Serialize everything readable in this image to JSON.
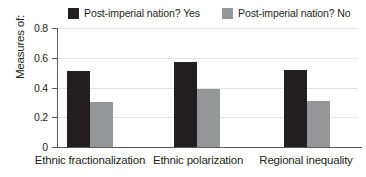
{
  "chart_data": {
    "type": "bar",
    "title": "",
    "xlabel": "",
    "ylabel": "Measures of:",
    "ylim": [
      0,
      0.8
    ],
    "yticks": [
      "0",
      "0.2",
      "0.4",
      "0.6",
      "0.8"
    ],
    "grid": true,
    "legend_position": "top",
    "categories": [
      "Ethnic fractionalization",
      "Ethnic polarization",
      "Regional inequality"
    ],
    "series": [
      {
        "name": "Post-imperial nation? Yes",
        "color": "#231f20",
        "values": [
          0.51,
          0.57,
          0.52
        ]
      },
      {
        "name": "Post-imperial nation? No",
        "color": "#949698",
        "values": [
          0.3,
          0.39,
          0.31
        ]
      }
    ]
  },
  "legend": {
    "entries": [
      {
        "label": "Post-imperial nation? Yes"
      },
      {
        "label": "Post-imperial nation? No"
      }
    ]
  },
  "axes": {
    "y_title": "Measures of:",
    "y_ticks": [
      {
        "label": "0.8"
      },
      {
        "label": "0.6"
      },
      {
        "label": "0.4"
      },
      {
        "label": "0.2"
      },
      {
        "label": "0"
      }
    ],
    "x_categories": [
      {
        "label": "Ethnic fractionalization"
      },
      {
        "label": "Ethnic polarization"
      },
      {
        "label": "Regional inequality"
      }
    ]
  }
}
